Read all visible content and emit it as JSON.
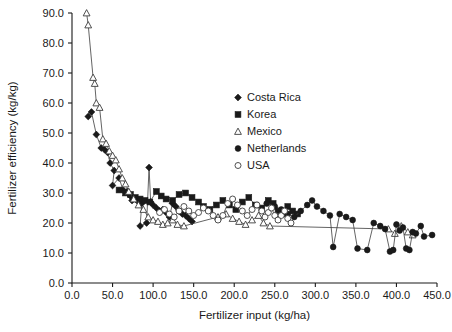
{
  "chart_data": {
    "type": "scatter",
    "title": "",
    "xlabel": "Fertilizer input (kg/ha)",
    "ylabel": "Fertilizer efficiency (kg/kg)",
    "xlim": [
      0,
      450
    ],
    "ylim": [
      0,
      90
    ],
    "xticks": [
      0,
      50,
      100,
      150,
      200,
      250,
      300,
      350,
      400,
      450
    ],
    "xtick_labels": [
      "0.0",
      "50.0",
      "100.0",
      "150.0",
      "200.0",
      "250.0",
      "300.0",
      "350.0",
      "400.0",
      "450.0"
    ],
    "yticks": [
      0,
      10,
      20,
      30,
      40,
      50,
      60,
      70,
      80,
      90
    ],
    "ytick_labels": [
      "0.0",
      "10.0",
      "20.0",
      "30.0",
      "40.0",
      "50.0",
      "60.0",
      "70.0",
      "80.0",
      "90.0"
    ],
    "grid": false,
    "legend_position": "upper-center-right",
    "connected": true,
    "series": [
      {
        "name": "Costa Rica",
        "marker": "filled-diamond",
        "color": "#1a1a1a",
        "points": [
          [
            20,
            55.5
          ],
          [
            24,
            57.0
          ],
          [
            30,
            49.5
          ],
          [
            36,
            45.0
          ],
          [
            40,
            44.5
          ],
          [
            44,
            43.5
          ],
          [
            47,
            40.0
          ],
          [
            52,
            37.5
          ],
          [
            50,
            32.5
          ],
          [
            58,
            35.0
          ],
          [
            63,
            31.0
          ],
          [
            68,
            30.5
          ],
          [
            72,
            29.0
          ],
          [
            74,
            27.5
          ],
          [
            78,
            28.0
          ],
          [
            82,
            27.0
          ],
          [
            86,
            26.5
          ],
          [
            84,
            19.0
          ],
          [
            92,
            20.0
          ],
          [
            95,
            38.5
          ],
          [
            97,
            27.0
          ],
          [
            100,
            26.0
          ],
          [
            104,
            25.0
          ],
          [
            108,
            24.0
          ],
          [
            112,
            24.5
          ],
          [
            116,
            23.5
          ],
          [
            120,
            22.0
          ],
          [
            124,
            26.5
          ],
          [
            128,
            25.5
          ],
          [
            132,
            24.0
          ],
          [
            136,
            23.0
          ],
          [
            140,
            22.5
          ],
          [
            144,
            21.5
          ],
          [
            148,
            20.5
          ]
        ]
      },
      {
        "name": "Korea",
        "marker": "filled-square",
        "color": "#1a1a1a",
        "points": [
          [
            58,
            31.0
          ],
          [
            66,
            30.0
          ],
          [
            72,
            29.5
          ],
          [
            78,
            28.5
          ],
          [
            84,
            28.0
          ],
          [
            90,
            27.5
          ],
          [
            96,
            27.0
          ],
          [
            104,
            30.5
          ],
          [
            110,
            29.0
          ],
          [
            116,
            28.0
          ],
          [
            124,
            27.5
          ],
          [
            132,
            29.5
          ],
          [
            140,
            30.0
          ],
          [
            148,
            28.5
          ],
          [
            156,
            27.0
          ],
          [
            162,
            25.5
          ],
          [
            170,
            24.5
          ],
          [
            178,
            26.0
          ],
          [
            186,
            27.5
          ],
          [
            194,
            26.0
          ],
          [
            202,
            24.5
          ],
          [
            210,
            27.0
          ],
          [
            218,
            28.5
          ],
          [
            226,
            26.0
          ],
          [
            234,
            25.0
          ],
          [
            242,
            27.5
          ],
          [
            248,
            26.5
          ],
          [
            254,
            24.0
          ],
          [
            260,
            23.0
          ],
          [
            266,
            25.5
          ],
          [
            272,
            24.0
          ],
          [
            278,
            23.0
          ]
        ]
      },
      {
        "name": "Mexico",
        "marker": "open-triangle",
        "color": "#3c3c3c",
        "points": [
          [
            18,
            90.0
          ],
          [
            20,
            86.0
          ],
          [
            26,
            68.5
          ],
          [
            28,
            66.5
          ],
          [
            30,
            60.0
          ],
          [
            34,
            58.5
          ],
          [
            38,
            48.0
          ],
          [
            42,
            46.5
          ],
          [
            46,
            44.0
          ],
          [
            50,
            42.5
          ],
          [
            54,
            41.0
          ],
          [
            58,
            38.0
          ],
          [
            62,
            35.0
          ],
          [
            66,
            33.0
          ],
          [
            70,
            30.5
          ],
          [
            76,
            28.0
          ],
          [
            82,
            26.0
          ],
          [
            88,
            24.5
          ],
          [
            94,
            22.0
          ],
          [
            100,
            21.0
          ],
          [
            106,
            20.5
          ],
          [
            112,
            19.5
          ],
          [
            118,
            20.0
          ],
          [
            124,
            21.0
          ],
          [
            130,
            19.5
          ],
          [
            138,
            19.0
          ],
          [
            180,
            22.0
          ],
          [
            190,
            23.0
          ],
          [
            198,
            21.5
          ],
          [
            206,
            20.5
          ],
          [
            214,
            19.5
          ],
          [
            222,
            21.0
          ],
          [
            230,
            22.5
          ],
          [
            236,
            20.0
          ],
          [
            244,
            19.0
          ],
          [
            390,
            18.0
          ],
          [
            398,
            16.5
          ],
          [
            406,
            19.0
          ],
          [
            414,
            17.0
          ],
          [
            420,
            16.0
          ]
        ]
      },
      {
        "name": "Netherlands",
        "marker": "filled-circle",
        "color": "#1a1a1a",
        "points": [
          [
            240,
            26.5
          ],
          [
            250,
            25.5
          ],
          [
            258,
            24.5
          ],
          [
            266,
            23.0
          ],
          [
            274,
            22.0
          ],
          [
            282,
            24.0
          ],
          [
            290,
            26.0
          ],
          [
            296,
            27.5
          ],
          [
            302,
            25.5
          ],
          [
            310,
            24.0
          ],
          [
            318,
            22.5
          ],
          [
            322,
            12.0
          ],
          [
            330,
            23.0
          ],
          [
            338,
            22.0
          ],
          [
            346,
            21.0
          ],
          [
            352,
            11.5
          ],
          [
            364,
            11.0
          ],
          [
            372,
            20.0
          ],
          [
            380,
            19.0
          ],
          [
            386,
            18.0
          ],
          [
            392,
            10.5
          ],
          [
            396,
            11.0
          ],
          [
            400,
            19.5
          ],
          [
            404,
            17.5
          ],
          [
            408,
            18.5
          ],
          [
            412,
            11.5
          ],
          [
            416,
            11.0
          ],
          [
            420,
            17.0
          ],
          [
            424,
            16.5
          ],
          [
            430,
            19.0
          ],
          [
            434,
            15.5
          ],
          [
            444,
            16.0
          ]
        ]
      },
      {
        "name": "USA",
        "marker": "open-circle",
        "color": "#3c3c3c",
        "points": [
          [
            108,
            23.5
          ],
          [
            114,
            24.5
          ],
          [
            120,
            23.0
          ],
          [
            126,
            22.0
          ],
          [
            132,
            24.0
          ],
          [
            138,
            25.5
          ],
          [
            144,
            24.0
          ],
          [
            150,
            22.5
          ],
          [
            156,
            23.5
          ],
          [
            162,
            25.0
          ],
          [
            168,
            24.0
          ],
          [
            174,
            22.5
          ],
          [
            180,
            21.0
          ],
          [
            186,
            22.5
          ],
          [
            192,
            26.5
          ],
          [
            198,
            28.0
          ],
          [
            204,
            26.0
          ],
          [
            210,
            24.0
          ],
          [
            216,
            22.5
          ],
          [
            222,
            24.5
          ],
          [
            228,
            26.0
          ],
          [
            234,
            24.0
          ],
          [
            238,
            22.0
          ],
          [
            242,
            23.5
          ],
          [
            246,
            25.0
          ],
          [
            250,
            22.5
          ],
          [
            254,
            21.0
          ],
          [
            258,
            22.5
          ],
          [
            262,
            24.0
          ],
          [
            266,
            21.5
          ],
          [
            270,
            20.0
          ]
        ]
      }
    ]
  },
  "legend": {
    "items": [
      {
        "label": "Costa Rica",
        "marker": "filled-diamond"
      },
      {
        "label": "Korea",
        "marker": "filled-square"
      },
      {
        "label": "Mexico",
        "marker": "open-triangle"
      },
      {
        "label": "Netherlands",
        "marker": "filled-circle"
      },
      {
        "label": "USA",
        "marker": "open-circle"
      }
    ]
  }
}
